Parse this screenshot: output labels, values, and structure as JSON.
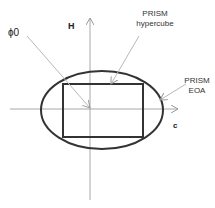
{
  "diagram": {
    "labels": {
      "phi": "ϕ0",
      "h_axis": "H",
      "c_axis": "c",
      "hypercube_line1": "PRISM",
      "hypercube_line2": "hypercube",
      "eoa_line1": "PRISM",
      "eoa_line2": "EOA"
    },
    "colors": {
      "axis": "#a0a0a0",
      "shape": "#333333",
      "arrow": "#b0b0b0"
    }
  }
}
